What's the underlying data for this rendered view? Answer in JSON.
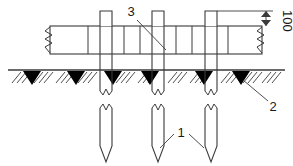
{
  "drawing": {
    "type": "engineering-section-drawing",
    "subject": "pile-foundation-with-capping-beam",
    "background_color": "#ffffff",
    "line_color": "#3a3a3a",
    "fill_color": "#000000",
    "canvas": {
      "width": 293,
      "height": 166
    }
  },
  "labels": [
    {
      "id": "label-3",
      "text": "3",
      "x": 131,
      "y": 16,
      "rotated": false,
      "meaning": "capping-beam-callout",
      "leader": {
        "from_x": 136,
        "from_y": 19,
        "to_x": 165,
        "to_y": 48
      }
    },
    {
      "id": "label-2",
      "text": "2",
      "x": 272,
      "y": 108,
      "rotated": false,
      "meaning": "ground-soil-callout",
      "leader": {
        "from_x": 269,
        "from_y": 103,
        "to_x": 243,
        "to_y": 82
      }
    },
    {
      "id": "label-1",
      "text": "1",
      "x": 178,
      "y": 134,
      "rotated": false,
      "meaning": "pile-callout",
      "leaders": [
        {
          "from_x": 175,
          "from_y": 135,
          "to_x": 160,
          "to_y": 147
        },
        {
          "from_x": 188,
          "from_y": 135,
          "to_x": 203,
          "to_y": 147
        }
      ]
    },
    {
      "id": "dimension-100",
      "text": "100",
      "x": 283,
      "y": 12,
      "rotated": true,
      "meaning": "pile-projection-height-dimension",
      "unit_implied": "mm"
    }
  ],
  "geometry": {
    "beam": {
      "name": "capping-beam",
      "left": 50,
      "right": 262,
      "top": 26,
      "bottom": 54,
      "break_lines": {
        "left_x": 50,
        "right_x": 262
      }
    },
    "ground_line": {
      "y": 70,
      "left": 8,
      "right": 285
    },
    "piles": [
      {
        "index": 1,
        "x_left": 100,
        "x_right": 112,
        "top": 11,
        "break_y": 92,
        "tip_restart_y": 104,
        "tip_y": 162
      },
      {
        "index": 2,
        "x_left": 152,
        "x_right": 164,
        "top": 11,
        "break_y": 92,
        "tip_restart_y": 104,
        "tip_y": 162
      },
      {
        "index": 3,
        "x_left": 205,
        "x_right": 217,
        "top": 11,
        "break_y": 92,
        "tip_restart_y": 104,
        "tip_y": 162
      }
    ],
    "beam_internal_verticals": [
      88,
      124,
      140,
      176,
      192,
      228
    ],
    "soil_wedges": 6,
    "dimension_extension_line": {
      "x_start": 217,
      "x_end": 272,
      "y": 11
    },
    "dimension_arrow_line": {
      "x": 266,
      "y_top": 11,
      "y_bottom": 26
    }
  }
}
